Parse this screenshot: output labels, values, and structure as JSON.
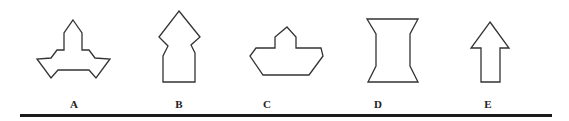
{
  "figure": {
    "stroke_color": "#333333",
    "shapes": [
      {
        "label": "A",
        "points": "73,20 82,33 82,50 89,50 95,58 110,59 96,78 89,70 58,70 51,78 37,59 51,58 57,50 64,50 64,33"
      },
      {
        "label": "B",
        "points": "179,11 200,37 191,45 195,53 195,82 163,82 163,56 168,46 159,37"
      },
      {
        "label": "C",
        "points": "287,27 296,37 296,48 321,48 323,56 309,75 263,75 250,56 256,48 275,48 275,37"
      },
      {
        "label": "D",
        "points": "367,19 418,19 410,34 410,66 418,82 368,82 376,66 376,34"
      },
      {
        "label": "E",
        "points": "490,22 509,48 500,48 500,82 481,82 481,48 471,48"
      }
    ],
    "labels": {
      "a": "A",
      "b": "B",
      "c": "C",
      "d": "D",
      "e": "E"
    }
  }
}
